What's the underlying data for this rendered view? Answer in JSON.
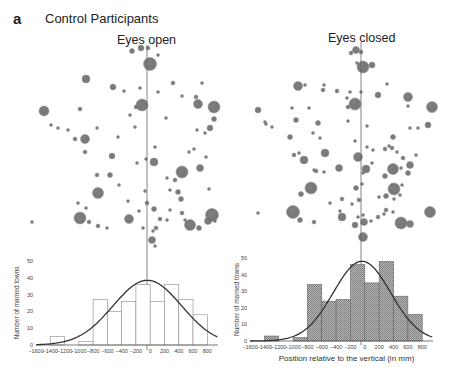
{
  "figure": {
    "panel_letter": "a",
    "panel_title": "Control Participants",
    "left_title": "Eyes open",
    "right_title": "Eyes closed"
  },
  "colors": {
    "dot": "#6b6b6b",
    "dot_edge": "#555555",
    "line": "#333333",
    "hist_fill_open": "#ffffff",
    "hist_fill_closed": "#9a9a9a",
    "axis": "#555555"
  },
  "chart_data": [
    {
      "type": "bar",
      "title": "Eyes open",
      "xlabel": "",
      "ylabel": "Number of marned towns",
      "ylim": [
        0,
        55
      ],
      "xlim": [
        -1600,
        950
      ],
      "x_ticks": [
        -1600,
        -1400,
        -1200,
        -1000,
        -800,
        -600,
        -400,
        -200,
        0,
        200,
        400,
        600,
        800
      ],
      "y_ticks": [
        0,
        10,
        20,
        30,
        40,
        50
      ],
      "bins": [
        [
          -1400,
          -1200
        ],
        [
          -1000,
          -800
        ],
        [
          -800,
          -600
        ],
        [
          -600,
          -400
        ],
        [
          -400,
          -200
        ],
        [
          -200,
          0
        ],
        [
          0,
          200
        ],
        [
          200,
          400
        ],
        [
          400,
          600
        ],
        [
          600,
          800
        ]
      ],
      "values": [
        5,
        2,
        27,
        20,
        26,
        36,
        26,
        36,
        27,
        18
      ],
      "fit": {
        "type": "gaussian",
        "mean": -40,
        "sd": 480,
        "peak": 38.5
      },
      "grid": false,
      "fill": "open"
    },
    {
      "type": "bar",
      "title": "Eyes closed",
      "xlabel": "Position relative to the vertical (in mm)",
      "ylabel": "Number of marned towns",
      "ylim": [
        0,
        55
      ],
      "xlim": [
        -1600,
        950
      ],
      "x_ticks": [
        -1600,
        -1400,
        -1200,
        -1000,
        -800,
        -600,
        -400,
        -200,
        0,
        200,
        400,
        600,
        800
      ],
      "y_ticks": [
        0,
        10,
        20,
        30,
        40,
        50
      ],
      "bins": [
        [
          -1400,
          -1200
        ],
        [
          -1000,
          -800
        ],
        [
          -800,
          -600
        ],
        [
          -600,
          -400
        ],
        [
          -400,
          -200
        ],
        [
          -200,
          0
        ],
        [
          0,
          200
        ],
        [
          200,
          400
        ],
        [
          400,
          600
        ],
        [
          600,
          800
        ]
      ],
      "values": [
        3,
        2,
        34,
        24,
        25,
        46,
        35,
        48,
        27,
        16
      ],
      "fit": {
        "type": "gaussian",
        "mean": -40,
        "sd": 400,
        "peak": 48
      },
      "grid": false,
      "fill": "hatched"
    }
  ],
  "axes": {
    "x_tick_labels": [
      "−1600",
      "−1400",
      "−1200",
      "−1000",
      "−800",
      "−600",
      "−400",
      "−200",
      "0",
      "200",
      "400",
      "600",
      "800"
    ],
    "y_tick_labels": [
      "0",
      "10",
      "20",
      "30",
      "40",
      "50"
    ],
    "ylabel": "Number of marned towns",
    "xlabel_right": "Position relative to the vertical (in mm)"
  }
}
